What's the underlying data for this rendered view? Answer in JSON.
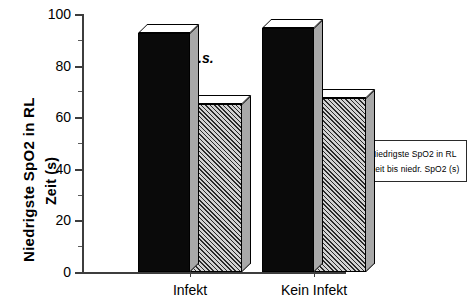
{
  "chart_data": {
    "type": "bar",
    "title": "",
    "subtitle": "",
    "xlabel": "",
    "ylabel": "Niedrigste SpO2 in RL",
    "ylabel_secondary": "Zeit (s)",
    "categories": [
      "Infekt",
      "Kein Infekt"
    ],
    "series": [
      {
        "name": "Niedrigste SpO2 in RL",
        "values": [
          92.5,
          94.5
        ],
        "fill": "solid-black"
      },
      {
        "name": "Zeit bis niedr. SpO2 (s)",
        "values": [
          65,
          67.5
        ],
        "fill": "hatched"
      }
    ],
    "ylim": [
      0,
      100
    ],
    "yticks": [
      0,
      20,
      40,
      60,
      80,
      100
    ],
    "yticks_minor": [
      10,
      30,
      50,
      70,
      90
    ],
    "grid": false,
    "legend_position": "lower-right",
    "annotations": [
      {
        "text": "p = n.s.",
        "style": "bold-italic"
      }
    ],
    "style": "3d-bars"
  },
  "axis": {
    "y_tick_labels": [
      "0",
      "20",
      "40",
      "60",
      "80",
      "100"
    ],
    "x_tick_labels": [
      "Infekt",
      "Kein Infekt"
    ],
    "y_title_primary": "Niedrigste SpO2 in RL",
    "y_title_secondary": "Zeit (s)"
  },
  "annotation": {
    "p_value": "p = n.s."
  },
  "legend": {
    "items": [
      {
        "label": "Niedrigste SpO2 in RL"
      },
      {
        "label": "Zeit bis niedr. SpO2 (s)"
      }
    ]
  },
  "colors": {
    "bar_solid": "#0a0a0a",
    "bar_hatch_base": "#d2d2d2",
    "bar_hatch_line": "#2b2b2b",
    "bar_top": "#ffffff",
    "bar_side": "#a8a8a8",
    "axis": "#3d3d3d",
    "background": "#ffffff"
  }
}
